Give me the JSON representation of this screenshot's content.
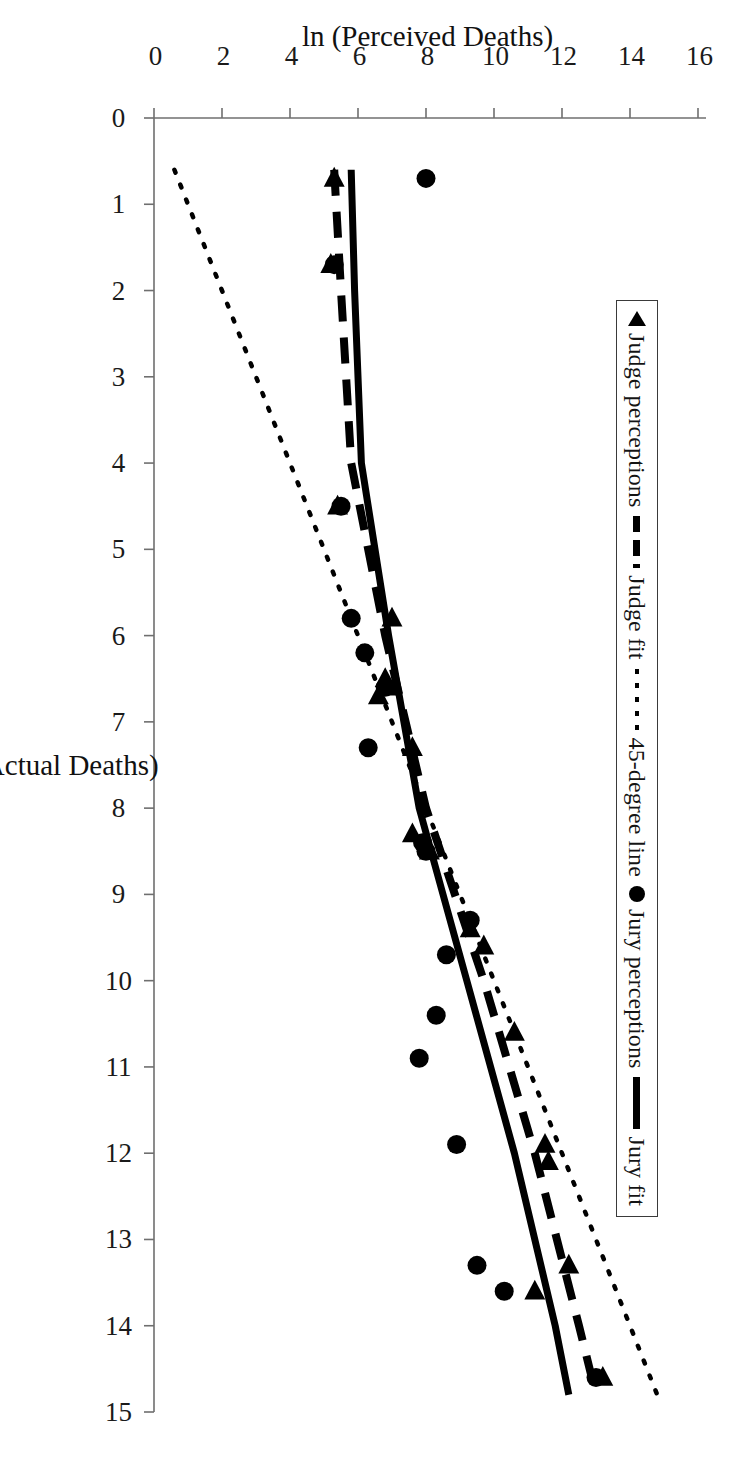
{
  "figure": {
    "rotation_note": "page-rotated-90-clockwise"
  },
  "axes": {
    "x": {
      "title": "ln (Actual Deaths)",
      "ticks": [
        "0",
        "1",
        "2",
        "3",
        "4",
        "5",
        "6",
        "7",
        "8",
        "9",
        "10",
        "11",
        "12",
        "13",
        "14",
        "15"
      ],
      "min": 0,
      "max": 15
    },
    "y": {
      "title": "ln (Perceived Deaths)",
      "ticks": [
        "0",
        "2",
        "4",
        "6",
        "8",
        "10",
        "12",
        "14",
        "16"
      ],
      "min": 0,
      "max": 16
    }
  },
  "legend": {
    "items": [
      {
        "label": "Judge perceptions",
        "marker": "triangle-left-icon"
      },
      {
        "label": "Judge fit",
        "marker": "dashed-line-icon"
      },
      {
        "label": "45-degree line",
        "marker": "dotted-line-icon"
      },
      {
        "label": "Jury perceptions",
        "marker": "filled-circle-icon"
      },
      {
        "label": "Jury fit",
        "marker": "solid-line-icon"
      }
    ]
  },
  "colors": {
    "ink": "#000000",
    "axis": "#6b6b6b",
    "background": "#ffffff"
  },
  "chart_data": {
    "type": "scatter",
    "title": "",
    "xlabel": "ln (Actual Deaths)",
    "ylabel": "ln (Perceived Deaths)",
    "xlim": [
      0,
      15
    ],
    "ylim": [
      0,
      16
    ],
    "grid": false,
    "legend_position": "upper-left",
    "series": [
      {
        "name": "Judge perceptions",
        "marker": "triangle",
        "points": [
          [
            0.7,
            5.3
          ],
          [
            1.7,
            5.2
          ],
          [
            4.5,
            5.4
          ],
          [
            5.8,
            7.0
          ],
          [
            6.5,
            6.8
          ],
          [
            6.6,
            6.9
          ],
          [
            6.7,
            6.6
          ],
          [
            7.3,
            7.6
          ],
          [
            8.3,
            7.6
          ],
          [
            8.5,
            8.1
          ],
          [
            9.4,
            9.3
          ],
          [
            9.6,
            9.7
          ],
          [
            10.6,
            10.6
          ],
          [
            11.9,
            11.5
          ],
          [
            12.1,
            11.6
          ],
          [
            13.3,
            12.2
          ],
          [
            13.6,
            11.2
          ],
          [
            14.6,
            13.2
          ]
        ]
      },
      {
        "name": "Jury perceptions",
        "marker": "circle",
        "points": [
          [
            0.7,
            8.0
          ],
          [
            1.7,
            5.3
          ],
          [
            4.5,
            5.5
          ],
          [
            5.8,
            5.8
          ],
          [
            6.2,
            6.2
          ],
          [
            6.6,
            6.8
          ],
          [
            7.3,
            6.3
          ],
          [
            8.4,
            7.9
          ],
          [
            8.5,
            8.0
          ],
          [
            9.3,
            9.3
          ],
          [
            9.7,
            8.6
          ],
          [
            10.4,
            8.3
          ],
          [
            10.9,
            7.8
          ],
          [
            11.9,
            8.9
          ],
          [
            13.3,
            9.5
          ],
          [
            13.6,
            10.3
          ],
          [
            14.6,
            13.0
          ]
        ]
      }
    ],
    "lines": [
      {
        "name": "Jury fit",
        "style": "solid",
        "description": "regression of jury perceptions on actual deaths",
        "points": [
          [
            0.6,
            5.8
          ],
          [
            2.0,
            5.9
          ],
          [
            4.0,
            6.1
          ],
          [
            6.0,
            6.9
          ],
          [
            8.0,
            7.8
          ],
          [
            10.0,
            9.2
          ],
          [
            12.0,
            10.6
          ],
          [
            14.0,
            11.8
          ],
          [
            14.8,
            12.2
          ]
        ]
      },
      {
        "name": "Judge fit",
        "style": "dashed",
        "description": "regression of judge perceptions on actual deaths",
        "points": [
          [
            0.6,
            5.3
          ],
          [
            2.0,
            5.5
          ],
          [
            4.0,
            5.8
          ],
          [
            6.0,
            6.8
          ],
          [
            8.0,
            8.0
          ],
          [
            10.0,
            9.7
          ],
          [
            12.0,
            11.2
          ],
          [
            14.0,
            12.5
          ],
          [
            14.8,
            13.0
          ]
        ]
      },
      {
        "name": "45-degree line",
        "style": "dotted",
        "description": "perfect-calibration reference y = x",
        "points": [
          [
            0.6,
            0.6
          ],
          [
            14.8,
            14.8
          ]
        ]
      }
    ]
  }
}
